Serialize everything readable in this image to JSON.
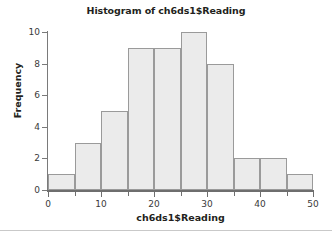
{
  "chart_data": {
    "type": "bar",
    "title": "Histogram of ch6ds1$Reading",
    "xlabel": "ch6ds1$Reading",
    "ylabel": "Frequency",
    "categories": [
      "0-5",
      "5-10",
      "10-15",
      "15-20",
      "20-25",
      "25-30",
      "30-35",
      "35-40",
      "40-45",
      "45-50"
    ],
    "bin_edges": [
      0,
      5,
      10,
      15,
      20,
      25,
      30,
      35,
      40,
      45,
      50
    ],
    "values": [
      1,
      3,
      5,
      9,
      9,
      10,
      8,
      2,
      2,
      1
    ],
    "xlim": [
      0,
      50
    ],
    "ylim": [
      0,
      10
    ],
    "x_tick_labels": [
      "0",
      "10",
      "20",
      "30",
      "40",
      "50"
    ],
    "x_tick_values": [
      0,
      10,
      20,
      30,
      40,
      50
    ],
    "x_minor_tick_values": [
      5,
      15,
      25,
      35,
      45
    ],
    "y_tick_labels": [
      "0",
      "2",
      "4",
      "6",
      "8",
      "10"
    ],
    "y_tick_values": [
      0,
      2,
      4,
      6,
      8,
      10
    ],
    "grid": false,
    "legend": null,
    "bar_fill_color": "#ebebeb",
    "bar_border_color": "#9a9a9a",
    "axis_color": "#6e6e6e",
    "text_color": "#231f20",
    "background_color": "#ffffff"
  }
}
